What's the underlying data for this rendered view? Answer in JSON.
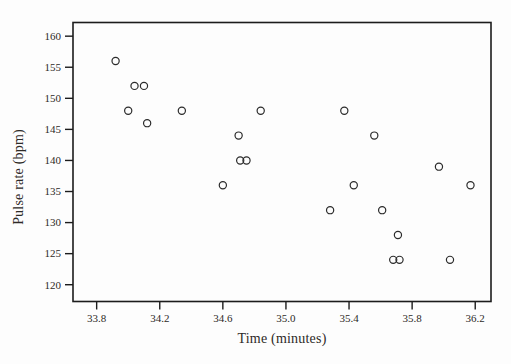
{
  "figure": {
    "background": "#fdfdfd",
    "ink_color": "#2d2a27",
    "frame_color": "#1c1c1c",
    "marker_color": "#2b2b2b"
  },
  "chart_data": {
    "type": "scatter",
    "title": "",
    "xlabel": "Time (minutes)",
    "ylabel": "Pulse rate (bpm)",
    "xlim": [
      33.65,
      36.3
    ],
    "ylim": [
      117.3,
      162.2
    ],
    "grid": false,
    "legend": null,
    "x_tick_values": [
      33.8,
      34.2,
      34.6,
      35.0,
      35.4,
      35.8,
      36.2
    ],
    "x_tick_labels": [
      "33.8",
      "34.2",
      "34.6",
      "35.0",
      "35.4",
      "35.8",
      "36.2"
    ],
    "y_tick_values": [
      120,
      125,
      130,
      135,
      140,
      145,
      150,
      155,
      160
    ],
    "y_tick_labels": [
      "120",
      "125",
      "130",
      "135",
      "140",
      "145",
      "150",
      "155",
      "160"
    ],
    "marker": {
      "shape": "open-circle",
      "radius": 3.6
    },
    "points": [
      {
        "x": 33.92,
        "y": 156
      },
      {
        "x": 34.0,
        "y": 148
      },
      {
        "x": 34.04,
        "y": 152
      },
      {
        "x": 34.1,
        "y": 152
      },
      {
        "x": 34.12,
        "y": 146
      },
      {
        "x": 34.34,
        "y": 148
      },
      {
        "x": 34.6,
        "y": 136
      },
      {
        "x": 34.7,
        "y": 144
      },
      {
        "x": 34.71,
        "y": 140
      },
      {
        "x": 34.75,
        "y": 140
      },
      {
        "x": 34.84,
        "y": 148
      },
      {
        "x": 35.28,
        "y": 132
      },
      {
        "x": 35.37,
        "y": 148
      },
      {
        "x": 35.43,
        "y": 136
      },
      {
        "x": 35.56,
        "y": 144
      },
      {
        "x": 35.61,
        "y": 132
      },
      {
        "x": 35.68,
        "y": 124
      },
      {
        "x": 35.71,
        "y": 128
      },
      {
        "x": 35.72,
        "y": 124
      },
      {
        "x": 35.97,
        "y": 139
      },
      {
        "x": 36.04,
        "y": 124
      },
      {
        "x": 36.17,
        "y": 136
      }
    ]
  }
}
